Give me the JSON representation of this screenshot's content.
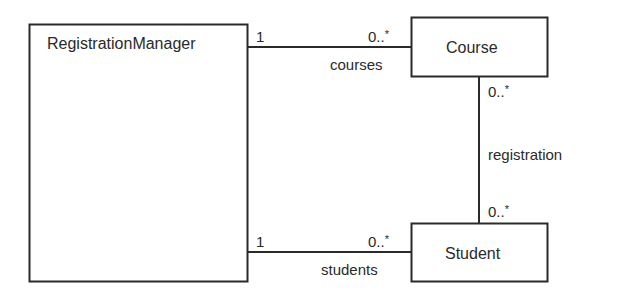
{
  "diagram": {
    "type": "UML class diagram",
    "classes": [
      {
        "id": "registration_manager",
        "name": "RegistrationManager"
      },
      {
        "id": "course",
        "name": "Course"
      },
      {
        "id": "student",
        "name": "Student"
      }
    ],
    "associations": [
      {
        "id": "courses",
        "from": "RegistrationManager",
        "to": "Course",
        "role": "courses",
        "from_multiplicity": "1",
        "to_multiplicity": "0..*"
      },
      {
        "id": "students",
        "from": "RegistrationManager",
        "to": "Student",
        "role": "students",
        "from_multiplicity": "1",
        "to_multiplicity": "0..*"
      },
      {
        "id": "registration",
        "from": "Course",
        "to": "Student",
        "name": "registration",
        "from_multiplicity": "0..*",
        "to_multiplicity": "0..*"
      }
    ]
  },
  "labels": {
    "rm_name": "RegistrationManager",
    "course_name": "Course",
    "student_name": "Student",
    "courses_role": "courses",
    "students_role": "students",
    "registration_name": "registration",
    "one": "1",
    "zero": "0..",
    "star": "*"
  },
  "colors": {
    "line": "#2a2a2a",
    "background": "#ffffff"
  }
}
